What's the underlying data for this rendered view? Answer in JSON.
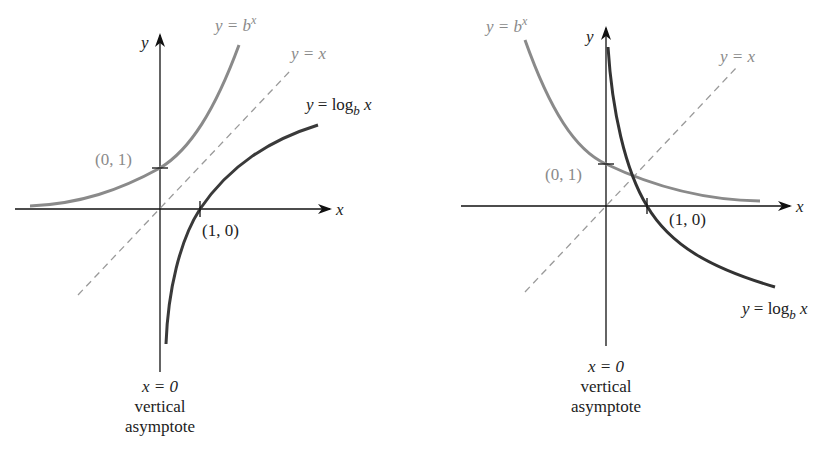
{
  "panels": [
    {
      "id": "left",
      "description": "Increasing case, b > 1",
      "axes": {
        "x_label": "x",
        "y_label": "y"
      },
      "curves": {
        "exponential": {
          "label_prefix": "y = b",
          "label_sup": "x",
          "color": "#8a8a8a"
        },
        "identity": {
          "label": "y = x",
          "color": "#9a9a9a",
          "style": "dashed"
        },
        "logarithm": {
          "label_prefix": "y = log",
          "label_sub": "b",
          "label_suffix": " x",
          "color": "#333333"
        }
      },
      "points": {
        "exp_intercept": "(0, 1)",
        "log_intercept": "(1, 0)"
      },
      "asymptote": {
        "equation": "x = 0",
        "line1": "vertical",
        "line2": "asymptote"
      }
    },
    {
      "id": "right",
      "description": "Decreasing case, 0 < b < 1",
      "axes": {
        "x_label": "x",
        "y_label": "y"
      },
      "curves": {
        "exponential": {
          "label_prefix": "y = b",
          "label_sup": "x",
          "color": "#8a8a8a"
        },
        "identity": {
          "label": "y = x",
          "color": "#9a9a9a",
          "style": "dashed"
        },
        "logarithm": {
          "label_prefix": "y = log",
          "label_sub": "b",
          "label_suffix": " x",
          "color": "#333333"
        }
      },
      "points": {
        "exp_intercept": "(0, 1)",
        "log_intercept": "(1, 0)"
      },
      "asymptote": {
        "equation": "x = 0",
        "line1": "vertical",
        "line2": "asymptote"
      }
    }
  ]
}
